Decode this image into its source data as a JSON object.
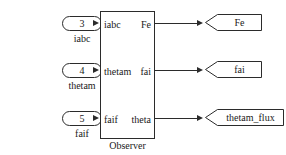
{
  "diagram": {
    "title": "Observer",
    "background_color": "#ffffff",
    "line_color": "#2b2b2b",
    "text_color": "#1a1a1a"
  },
  "inputs": [
    {
      "number": "3",
      "caption": "iabc",
      "icon": "inport-icon"
    },
    {
      "number": "4",
      "caption": "thetam",
      "icon": "inport-icon"
    },
    {
      "number": "5",
      "caption": "faif",
      "icon": "inport-icon"
    }
  ],
  "block": {
    "name": "Observer",
    "caption": "Observer",
    "input_labels": [
      "iabc",
      "thetam",
      "faif"
    ],
    "output_labels": [
      "Fe",
      "fai",
      "theta"
    ]
  },
  "outputs": [
    {
      "label": "Fe",
      "icon": "outport-icon"
    },
    {
      "label": "fai",
      "icon": "outport-icon"
    },
    {
      "label": "thetam_flux",
      "icon": "outport-icon"
    }
  ]
}
